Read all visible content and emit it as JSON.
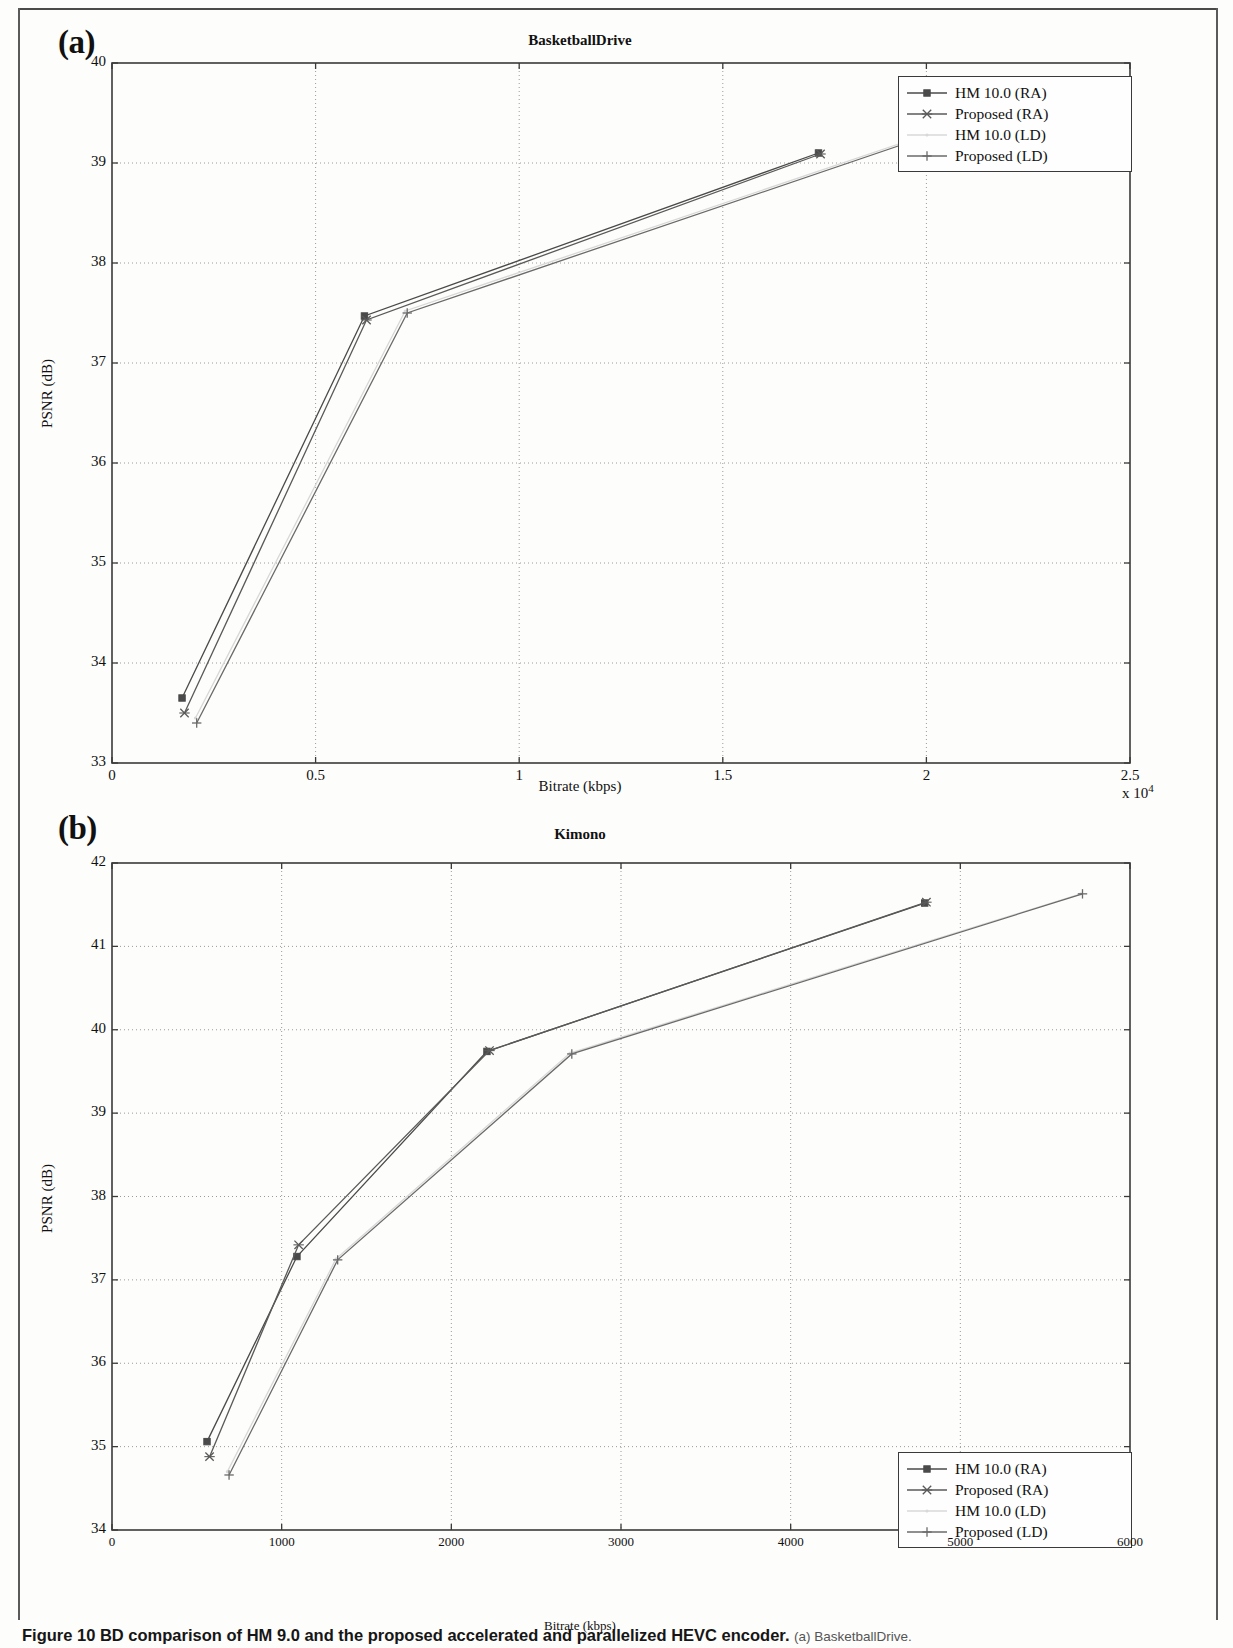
{
  "figure": {
    "caption_lead": "Figure 10",
    "caption_main": "BD comparison of HM 9.0 and the proposed accelerated and parallelized HEVC encoder.",
    "caption_tail": "(a) BasketballDrive."
  },
  "panels": {
    "a": {
      "letter": "(a)"
    },
    "b": {
      "letter": "(b)"
    }
  },
  "legend": {
    "series_labels": [
      "HM 10.0 (RA)",
      "Proposed (RA)",
      "HM 10.0 (LD)",
      "Proposed (LD)"
    ]
  },
  "colors": {
    "hm_ra": "#4a4a4a",
    "proposed_ra": "#5a5a5a",
    "hm_ld": "#d8d8d8",
    "proposed_ld": "#6a6a6a",
    "axis": "#3a3a3a",
    "grid": "#9a9a9a"
  },
  "chart_data": [
    {
      "id": "basketballdrive",
      "type": "line",
      "title": "BasketballDrive",
      "xlabel": "Bitrate (kbps)",
      "ylabel": "PSNR (dB)",
      "x_exponent_label": "x 10",
      "x_exponent_power": "4",
      "xlim": [
        0,
        25000
      ],
      "ylim": [
        33,
        40
      ],
      "xticks": [
        0,
        5000,
        10000,
        15000,
        20000,
        25000
      ],
      "xticklabels": [
        "0",
        "0.5",
        "1",
        "1.5",
        "2",
        "2.5"
      ],
      "yticks": [
        33,
        34,
        35,
        36,
        37,
        38,
        39,
        40
      ],
      "yticklabels": [
        "33",
        "34",
        "35",
        "36",
        "37",
        "38",
        "39",
        "40"
      ],
      "grid": true,
      "legend_position": "upper-right",
      "series": [
        {
          "name": "HM 10.0 (RA)",
          "marker": "square",
          "x": [
            1720,
            6200,
            17350
          ],
          "y": [
            33.65,
            37.47,
            39.1
          ]
        },
        {
          "name": "Proposed (RA)",
          "marker": "x",
          "x": [
            1780,
            6250,
            17400
          ],
          "y": [
            33.5,
            37.43,
            39.09
          ]
        },
        {
          "name": "HM 10.0 (LD)",
          "marker": "dot",
          "x": [
            2050,
            7200,
            20700
          ],
          "y": [
            33.45,
            37.52,
            39.38
          ]
        },
        {
          "name": "Proposed (LD)",
          "marker": "plus",
          "x": [
            2080,
            7250,
            20750
          ],
          "y": [
            33.4,
            37.5,
            39.37
          ]
        }
      ]
    },
    {
      "id": "kimono",
      "type": "line",
      "title": "Kimono",
      "xlabel": "Bitrate (kbps)",
      "ylabel": "PSNR (dB)",
      "xlim": [
        0,
        6000
      ],
      "ylim": [
        34,
        42
      ],
      "xticks": [
        0,
        1000,
        2000,
        3000,
        4000,
        5000,
        6000
      ],
      "xticklabels": [
        "0",
        "1000",
        "2000",
        "3000",
        "4000",
        "5000",
        "6000"
      ],
      "yticks": [
        34,
        35,
        36,
        37,
        38,
        39,
        40,
        41,
        42
      ],
      "yticklabels": [
        "34",
        "35",
        "36",
        "37",
        "38",
        "39",
        "40",
        "41",
        "42"
      ],
      "grid": true,
      "legend_position": "lower-right",
      "series": [
        {
          "name": "HM 10.0 (RA)",
          "marker": "square",
          "x": [
            560,
            1090,
            2210,
            4790
          ],
          "y": [
            35.06,
            37.28,
            39.74,
            41.52
          ]
        },
        {
          "name": "Proposed (RA)",
          "marker": "x",
          "x": [
            575,
            1100,
            2225,
            4800
          ],
          "y": [
            34.88,
            37.42,
            39.75,
            41.53
          ]
        },
        {
          "name": "HM 10.0 (LD)",
          "marker": "dot",
          "x": [
            680,
            1320,
            2700,
            5710
          ],
          "y": [
            34.7,
            37.25,
            39.72,
            41.63
          ]
        },
        {
          "name": "Proposed (LD)",
          "marker": "plus",
          "x": [
            690,
            1330,
            2710,
            5720
          ],
          "y": [
            34.66,
            37.24,
            39.71,
            41.63
          ]
        }
      ]
    }
  ]
}
